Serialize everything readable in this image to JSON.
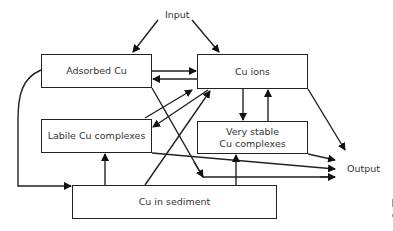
{
  "diagram": {
    "input_label": "Input",
    "output_label": "Output",
    "nodes": {
      "adsorbed": "Adsorbed Cu",
      "ions": "Cu ions",
      "labile": "Labile Cu complexes",
      "very_stable_line1": "Very stable",
      "very_stable_line2": "Cu complexes",
      "sediment": "Cu in sediment"
    },
    "edges": [
      {
        "from": "Input",
        "to": "Adsorbed Cu"
      },
      {
        "from": "Input",
        "to": "Cu ions"
      },
      {
        "from": "Adsorbed Cu",
        "to": "Cu ions"
      },
      {
        "from": "Cu ions",
        "to": "Adsorbed Cu"
      },
      {
        "from": "Labile Cu complexes",
        "to": "Cu ions"
      },
      {
        "from": "Cu ions",
        "to": "Labile Cu complexes"
      },
      {
        "from": "Cu in sediment",
        "to": "Cu ions"
      },
      {
        "from": "Cu ions",
        "to": "Very stable Cu complexes"
      },
      {
        "from": "Very stable Cu complexes",
        "to": "Cu ions"
      },
      {
        "from": "Cu in sediment",
        "to": "Labile Cu complexes"
      },
      {
        "from": "Cu in sediment",
        "to": "Very stable Cu complexes"
      },
      {
        "from": "Adsorbed Cu",
        "to": "Cu in sediment"
      },
      {
        "from": "Adsorbed Cu",
        "to": "Output"
      },
      {
        "from": "Labile Cu complexes",
        "to": "Output"
      },
      {
        "from": "Very stable Cu complexes",
        "to": "Output"
      },
      {
        "from": "Cu ions",
        "to": "Output"
      }
    ]
  }
}
